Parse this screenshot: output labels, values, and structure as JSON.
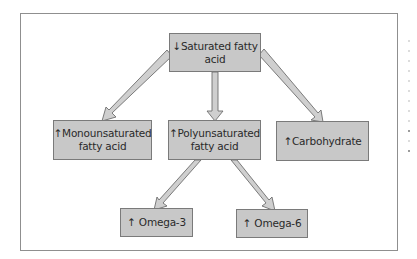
{
  "diagram": {
    "type": "flowchart",
    "colors": {
      "box_fill": "#c8c8c8",
      "box_border": "#7a7a7a",
      "arrow_fill": "#c8c8c8",
      "arrow_stroke": "#6e6e6e",
      "frame_border": "#8f8f8f",
      "text": "#2a2a2a"
    },
    "nodes": {
      "saturated": {
        "arrow": "↓",
        "line1": "Saturated fatty",
        "line2": "acid"
      },
      "monounsaturated": {
        "arrow": "↑",
        "line1": "Monounsaturated",
        "line2": "fatty acid"
      },
      "polyunsaturated": {
        "arrow": "↑",
        "line1": "Polyunsaturated",
        "line2": "fatty acid"
      },
      "carbohydrate": {
        "arrow": "↑",
        "line1": "Carbohydrate"
      },
      "omega3": {
        "arrow": "↑",
        "line1": "Omega-3"
      },
      "omega6": {
        "arrow": "↑",
        "line1": "Omega-6"
      }
    },
    "edges": [
      {
        "from": "saturated",
        "to": "monounsaturated"
      },
      {
        "from": "saturated",
        "to": "polyunsaturated"
      },
      {
        "from": "saturated",
        "to": "carbohydrate"
      },
      {
        "from": "polyunsaturated",
        "to": "omega3"
      },
      {
        "from": "polyunsaturated",
        "to": "omega6"
      }
    ]
  }
}
